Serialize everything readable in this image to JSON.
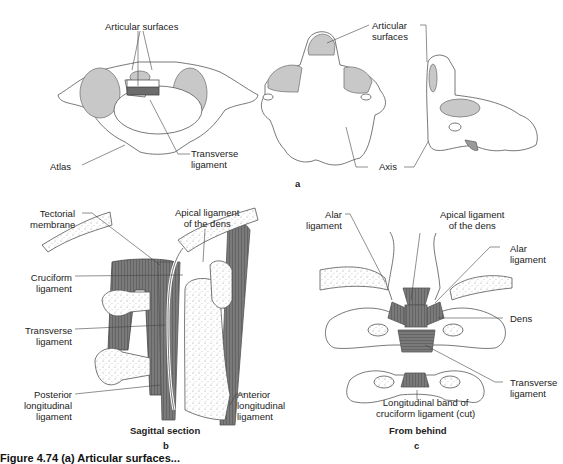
{
  "panel_a": {
    "letter": "a",
    "labels": {
      "articular_surfaces_atlas": "Articular surfaces",
      "atlas": "Atlas",
      "transverse_ligament": [
        "Transverse",
        "ligament"
      ],
      "articular_surfaces_axis": [
        "Articular",
        "surfaces"
      ],
      "axis": "Axis"
    }
  },
  "panel_b": {
    "letter": "b",
    "title": "Sagittal section",
    "labels": {
      "tectorial_membrane": [
        "Tectorial",
        "membrane"
      ],
      "apical_ligament": [
        "Apical ligament",
        "of the dens"
      ],
      "cruciform_ligament": [
        "Cruciform",
        "ligament"
      ],
      "transverse_ligament": [
        "Transverse",
        "ligament"
      ],
      "posterior_longitudinal": [
        "Posterior",
        "longitudinal",
        "ligament"
      ],
      "anterior_longitudinal": [
        "Anterior",
        "longitudinal",
        "ligament"
      ]
    }
  },
  "panel_c": {
    "letter": "c",
    "title": "From behind",
    "labels": {
      "alar_left": [
        "Alar",
        "ligament"
      ],
      "apical_ligament": [
        "Apical ligament",
        "of the dens"
      ],
      "alar_right": [
        "Alar",
        "ligament"
      ],
      "dens": "Dens",
      "transverse_ligament": [
        "Transverse",
        "ligament"
      ],
      "longitudinal_band": [
        "Longitudinal band of",
        "cruciform ligament (cut)"
      ]
    }
  },
  "caption_partial": "Figure 4.74 (a) Articular surfaces..."
}
